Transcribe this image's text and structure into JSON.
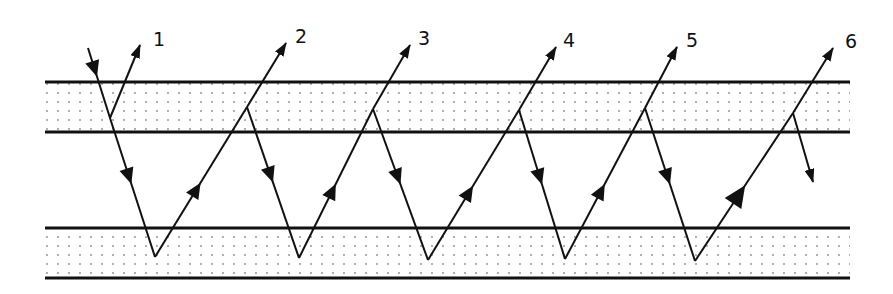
{
  "diagram": {
    "colors": {
      "ink": "#111111",
      "dot": "#8a8a8a",
      "background": "#ffffff"
    },
    "bands": [
      {
        "name": "upper-layer",
        "y_top": 82,
        "y_bottom": 132,
        "x_start": 45,
        "x_end": 850
      },
      {
        "name": "lower-layer",
        "y_top": 228,
        "y_bottom": 278,
        "x_start": 45,
        "x_end": 850
      }
    ],
    "incident_ray": {
      "points": [
        [
          88,
          48
        ],
        [
          110,
          118
        ],
        [
          155,
          257
        ]
      ]
    },
    "reflection_points_upper": [
      [
        110,
        118
      ],
      [
        247,
        107
      ],
      [
        373,
        109
      ],
      [
        519,
        110
      ],
      [
        645,
        108
      ],
      [
        793,
        113
      ]
    ],
    "reflection_points_lower": [
      [
        155,
        257
      ],
      [
        299,
        258
      ],
      [
        428,
        260
      ],
      [
        565,
        259
      ],
      [
        695,
        261
      ]
    ],
    "outgoing_rays": [
      {
        "label": "1",
        "from": [
          110,
          118
        ],
        "to": [
          140,
          45
        ],
        "label_pos": [
          153,
          46
        ]
      },
      {
        "label": "2",
        "from": [
          247,
          107
        ],
        "to": [
          286,
          43
        ],
        "label_pos": [
          295,
          43
        ]
      },
      {
        "label": "3",
        "from": [
          373,
          109
        ],
        "to": [
          410,
          45
        ],
        "label_pos": [
          418,
          45
        ]
      },
      {
        "label": "4",
        "from": [
          519,
          110
        ],
        "to": [
          556,
          47
        ],
        "label_pos": [
          563,
          47
        ]
      },
      {
        "label": "5",
        "from": [
          645,
          108
        ],
        "to": [
          677,
          47
        ],
        "label_pos": [
          686,
          47
        ]
      },
      {
        "label": "6",
        "from": [
          793,
          113
        ],
        "to": [
          833,
          48
        ],
        "label_pos": [
          845,
          48
        ]
      }
    ],
    "final_transmitted": {
      "from": [
        793,
        113
      ],
      "to": [
        813,
        182
      ]
    }
  }
}
